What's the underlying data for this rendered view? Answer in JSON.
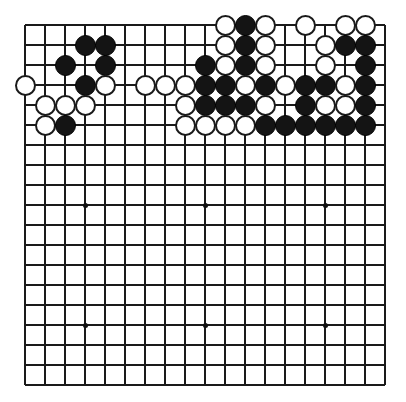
{
  "app": {
    "title": "Go Board Position",
    "board_type": "go-board",
    "size": 19
  },
  "board": {
    "size": 19,
    "origin_x": 25,
    "origin_y": 25,
    "spacing": 20,
    "line_color": "#1a1a1a",
    "background_color": "#ffffff",
    "black_color": "#141414",
    "white_color": "#ffffff",
    "stone_diameter": 21,
    "star_points": [
      {
        "col": 4,
        "row": 4
      },
      {
        "col": 10,
        "row": 4
      },
      {
        "col": 16,
        "row": 4
      },
      {
        "col": 4,
        "row": 10
      },
      {
        "col": 10,
        "row": 10
      },
      {
        "col": 16,
        "row": 10
      },
      {
        "col": 4,
        "row": 16
      },
      {
        "col": 10,
        "row": 16
      },
      {
        "col": 16,
        "row": 16
      }
    ],
    "visible_star_points": [
      {
        "col": 4,
        "row": 10
      },
      {
        "col": 10,
        "row": 10
      },
      {
        "col": 16,
        "row": 10
      },
      {
        "col": 4,
        "row": 16
      },
      {
        "col": 10,
        "row": 16
      },
      {
        "col": 16,
        "row": 16
      }
    ],
    "stones": [
      {
        "col": 11,
        "row": 1,
        "color": "white"
      },
      {
        "col": 12,
        "row": 1,
        "color": "black"
      },
      {
        "col": 13,
        "row": 1,
        "color": "white"
      },
      {
        "col": 15,
        "row": 1,
        "color": "white"
      },
      {
        "col": 17,
        "row": 1,
        "color": "white"
      },
      {
        "col": 18,
        "row": 1,
        "color": "white"
      },
      {
        "col": 4,
        "row": 2,
        "color": "black"
      },
      {
        "col": 5,
        "row": 2,
        "color": "black"
      },
      {
        "col": 11,
        "row": 2,
        "color": "white"
      },
      {
        "col": 12,
        "row": 2,
        "color": "black"
      },
      {
        "col": 13,
        "row": 2,
        "color": "white"
      },
      {
        "col": 16,
        "row": 2,
        "color": "white"
      },
      {
        "col": 17,
        "row": 2,
        "color": "black"
      },
      {
        "col": 18,
        "row": 2,
        "color": "black"
      },
      {
        "col": 3,
        "row": 3,
        "color": "black"
      },
      {
        "col": 5,
        "row": 3,
        "color": "black"
      },
      {
        "col": 10,
        "row": 3,
        "color": "black"
      },
      {
        "col": 11,
        "row": 3,
        "color": "white"
      },
      {
        "col": 12,
        "row": 3,
        "color": "black"
      },
      {
        "col": 13,
        "row": 3,
        "color": "white"
      },
      {
        "col": 16,
        "row": 3,
        "color": "white"
      },
      {
        "col": 18,
        "row": 3,
        "color": "black"
      },
      {
        "col": 1,
        "row": 4,
        "color": "white"
      },
      {
        "col": 4,
        "row": 4,
        "color": "black"
      },
      {
        "col": 5,
        "row": 4,
        "color": "white"
      },
      {
        "col": 7,
        "row": 4,
        "color": "white"
      },
      {
        "col": 8,
        "row": 4,
        "color": "white"
      },
      {
        "col": 9,
        "row": 4,
        "color": "white"
      },
      {
        "col": 10,
        "row": 4,
        "color": "black"
      },
      {
        "col": 11,
        "row": 4,
        "color": "black"
      },
      {
        "col": 12,
        "row": 4,
        "color": "white"
      },
      {
        "col": 13,
        "row": 4,
        "color": "black"
      },
      {
        "col": 14,
        "row": 4,
        "color": "white"
      },
      {
        "col": 15,
        "row": 4,
        "color": "black"
      },
      {
        "col": 16,
        "row": 4,
        "color": "black"
      },
      {
        "col": 17,
        "row": 4,
        "color": "white"
      },
      {
        "col": 18,
        "row": 4,
        "color": "black"
      },
      {
        "col": 2,
        "row": 5,
        "color": "white"
      },
      {
        "col": 3,
        "row": 5,
        "color": "white"
      },
      {
        "col": 4,
        "row": 5,
        "color": "white"
      },
      {
        "col": 9,
        "row": 5,
        "color": "white"
      },
      {
        "col": 10,
        "row": 5,
        "color": "black"
      },
      {
        "col": 11,
        "row": 5,
        "color": "black"
      },
      {
        "col": 12,
        "row": 5,
        "color": "black"
      },
      {
        "col": 13,
        "row": 5,
        "color": "white"
      },
      {
        "col": 15,
        "row": 5,
        "color": "black"
      },
      {
        "col": 16,
        "row": 5,
        "color": "white"
      },
      {
        "col": 17,
        "row": 5,
        "color": "white"
      },
      {
        "col": 18,
        "row": 5,
        "color": "black"
      },
      {
        "col": 2,
        "row": 6,
        "color": "white"
      },
      {
        "col": 3,
        "row": 6,
        "color": "black"
      },
      {
        "col": 9,
        "row": 6,
        "color": "white"
      },
      {
        "col": 10,
        "row": 6,
        "color": "white"
      },
      {
        "col": 11,
        "row": 6,
        "color": "white"
      },
      {
        "col": 12,
        "row": 6,
        "color": "white"
      },
      {
        "col": 13,
        "row": 6,
        "color": "black"
      },
      {
        "col": 14,
        "row": 6,
        "color": "black"
      },
      {
        "col": 15,
        "row": 6,
        "color": "black"
      },
      {
        "col": 16,
        "row": 6,
        "color": "black"
      },
      {
        "col": 17,
        "row": 6,
        "color": "black"
      },
      {
        "col": 18,
        "row": 6,
        "color": "black"
      }
    ]
  }
}
